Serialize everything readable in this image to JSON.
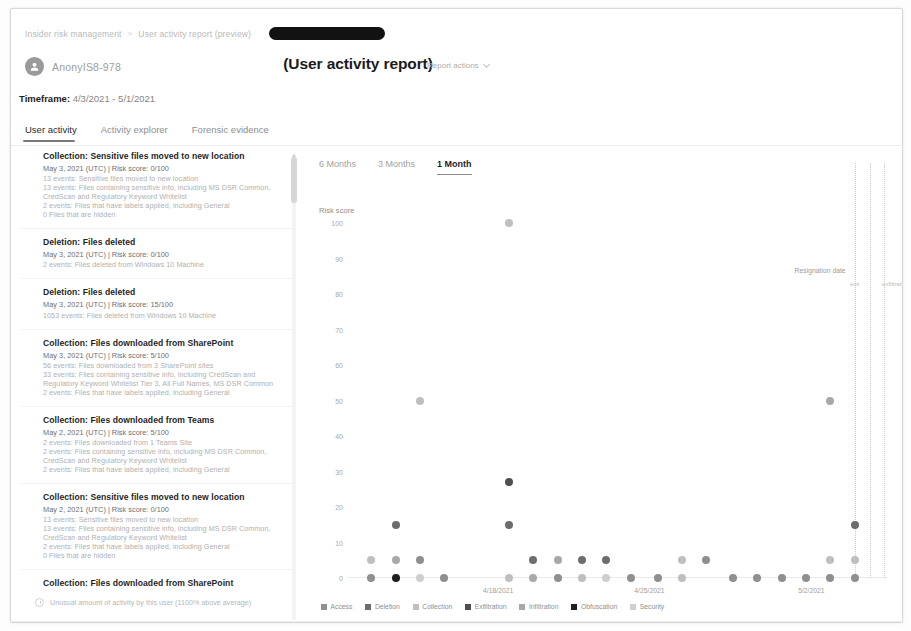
{
  "breadcrumb": {
    "items": [
      "Insider risk management",
      "User activity report (preview)"
    ],
    "separator": ">",
    "redacted": true
  },
  "header": {
    "username": "AnonyIS8-978",
    "avatar_icon": "person-icon",
    "report_title": "(User activity report)",
    "report_actions_label": "Report actions",
    "report_actions_icon": "chevron-down-icon"
  },
  "timeframe": {
    "label": "Timeframe:",
    "value": "4/3/2021 - 5/1/2021"
  },
  "tabs": [
    {
      "label": "User activity",
      "active": true
    },
    {
      "label": "Activity explorer",
      "active": false
    },
    {
      "label": "Forensic evidence",
      "active": false
    }
  ],
  "activity_list": {
    "scrollbar_icon": "vertical-scrollbar",
    "events": [
      {
        "icon": "collection-icon",
        "title": "Collection: Sensitive files moved to new location",
        "meta": "May 3, 2021 (UTC) | Risk score: 0/100",
        "lines": [
          "13 events: Sensitive files moved to new location",
          "13 events: Files containing sensitive info, including MS DSR Common,",
          "CredScan and Regulatory Keyword Whitelist",
          "2 events: Files that have labels applied, including General",
          "0 Files that are hidden"
        ]
      },
      {
        "icon": "deletion-icon",
        "title": "Deletion: Files deleted",
        "meta": "May 3, 2021 (UTC) | Risk score: 0/100",
        "lines": [
          "2 events: Files deleted from Windows 10 Machine"
        ]
      },
      {
        "icon": "deletion-icon",
        "title": "Deletion: Files deleted",
        "meta": "May 3, 2021 (UTC) | Risk score: 15/100",
        "lines": [
          "1053 events: Files deleted from Windows 10 Machine"
        ]
      },
      {
        "icon": "collection-icon",
        "title": "Collection: Files downloaded from SharePoint",
        "meta": "May 3, 2021 (UTC) | Risk score: 5/100",
        "lines": [
          "56 events: Files downloaded from 3 SharePoint sites",
          "33 events: Files containing sensitive info, including CredScan and",
          "Regulatory Keyword Whitelist Tier 3, All Full Names, MS DSR Common",
          "2 events: Files that have labels applied, including General"
        ]
      },
      {
        "icon": "collection-icon",
        "title": "Collection: Files downloaded from Teams",
        "meta": "May 2, 2021 (UTC) | Risk score: 5/100",
        "lines": [
          "2 events: Files downloaded from 1 Teams Site",
          "2 events: Files containing sensitive info, including MS DSR Common,",
          "CredScan and Regulatory Keyword Whitelist",
          "2 events: Files that have labels applied, including General"
        ]
      },
      {
        "icon": "collection-icon",
        "title": "Collection: Sensitive files moved to new location",
        "meta": "May 2, 2021 (UTC) | Risk score: 0/100",
        "lines": [
          "13 events: Sensitive files moved to new location",
          "13 events: Files containing sensitive info, including MS DSR Common,",
          "CredScan and Regulatory Keyword Whitelist",
          "2 events: Files that have labels applied, including General",
          "0 Files that are hidden"
        ]
      },
      {
        "icon": "collection-icon",
        "title": "Collection: Files downloaded from SharePoint",
        "meta": "",
        "lines": []
      }
    ],
    "insight": {
      "icon": "clock-icon",
      "text": "Unusual amount of activity by this user (1100% above average)"
    }
  },
  "chart_panel": {
    "range_tabs": [
      {
        "label": "6 Months",
        "active": false
      },
      {
        "label": "3 Months",
        "active": false
      },
      {
        "label": "1 Month",
        "active": true
      }
    ],
    "resignation": {
      "label": "Resignation date",
      "sub_labels": [
        "exit",
        "exfiltration"
      ]
    }
  },
  "chart_data": {
    "type": "scatter",
    "title": "",
    "xlabel": "",
    "ylabel": "Risk score",
    "ylim": [
      0,
      100
    ],
    "yticks": [
      0,
      10,
      20,
      30,
      40,
      50,
      60,
      70,
      80,
      90,
      100
    ],
    "xticks": [
      "4/18/2021",
      "4/25/2021",
      "5/2/2021"
    ],
    "xtick_positions": [
      0.28,
      0.56,
      0.86
    ],
    "grid": false,
    "legend_position": "bottom",
    "series": [
      {
        "name": "Access",
        "color": "#8f8f8f"
      },
      {
        "name": "Deletion",
        "color": "#6d6d6d"
      },
      {
        "name": "Collection",
        "color": "#bfbfbf"
      },
      {
        "name": "Exfiltration",
        "color": "#4f4f4f"
      },
      {
        "name": "Infiltration",
        "color": "#a8a8a8"
      },
      {
        "name": "Obfuscation",
        "color": "#1f1f1f"
      },
      {
        "name": "Security",
        "color": "#cfcfcf"
      }
    ],
    "points": [
      {
        "x": 0.045,
        "y": 5,
        "series": "Collection"
      },
      {
        "x": 0.045,
        "y": 0,
        "series": "Access"
      },
      {
        "x": 0.09,
        "y": 15,
        "series": "Deletion"
      },
      {
        "x": 0.09,
        "y": 5,
        "series": "Infiltration"
      },
      {
        "x": 0.09,
        "y": 0,
        "series": "Obfuscation"
      },
      {
        "x": 0.135,
        "y": 50,
        "series": "Collection"
      },
      {
        "x": 0.135,
        "y": 5,
        "series": "Access"
      },
      {
        "x": 0.135,
        "y": 0,
        "series": "Security"
      },
      {
        "x": 0.18,
        "y": 0,
        "series": "Access"
      },
      {
        "x": 0.3,
        "y": 100,
        "series": "Collection"
      },
      {
        "x": 0.3,
        "y": 27,
        "series": "Exfiltration"
      },
      {
        "x": 0.3,
        "y": 15,
        "series": "Deletion"
      },
      {
        "x": 0.3,
        "y": 0,
        "series": "Collection"
      },
      {
        "x": 0.345,
        "y": 5,
        "series": "Deletion"
      },
      {
        "x": 0.345,
        "y": 0,
        "series": "Infiltration"
      },
      {
        "x": 0.39,
        "y": 5,
        "series": "Infiltration"
      },
      {
        "x": 0.39,
        "y": 0,
        "series": "Access"
      },
      {
        "x": 0.435,
        "y": 5,
        "series": "Deletion"
      },
      {
        "x": 0.435,
        "y": 0,
        "series": "Collection"
      },
      {
        "x": 0.48,
        "y": 5,
        "series": "Deletion"
      },
      {
        "x": 0.48,
        "y": 0,
        "series": "Security"
      },
      {
        "x": 0.525,
        "y": 0,
        "series": "Access"
      },
      {
        "x": 0.575,
        "y": 0,
        "series": "Access"
      },
      {
        "x": 0.62,
        "y": 5,
        "series": "Collection"
      },
      {
        "x": 0.62,
        "y": 0,
        "series": "Collection"
      },
      {
        "x": 0.665,
        "y": 5,
        "series": "Access"
      },
      {
        "x": 0.715,
        "y": 0,
        "series": "Access"
      },
      {
        "x": 0.76,
        "y": 0,
        "series": "Access"
      },
      {
        "x": 0.805,
        "y": 0,
        "series": "Access"
      },
      {
        "x": 0.85,
        "y": 0,
        "series": "Access"
      },
      {
        "x": 0.895,
        "y": 50,
        "series": "Infiltration"
      },
      {
        "x": 0.895,
        "y": 5,
        "series": "Collection"
      },
      {
        "x": 0.895,
        "y": 0,
        "series": "Access"
      },
      {
        "x": 0.94,
        "y": 15,
        "series": "Deletion"
      },
      {
        "x": 0.94,
        "y": 5,
        "series": "Collection"
      },
      {
        "x": 0.94,
        "y": 0,
        "series": "Access"
      }
    ],
    "vlines": [
      0.94,
      0.968,
      0.995
    ]
  }
}
